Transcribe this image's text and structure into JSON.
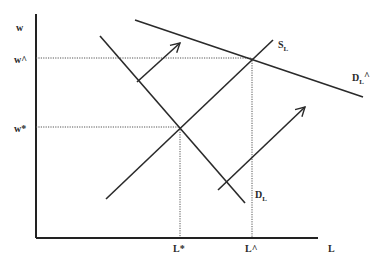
{
  "diagram": {
    "type": "labor-market supply and demand diagram",
    "axes": {
      "y_label": "w",
      "x_label": "L"
    },
    "y_ticks": [
      {
        "label": "w^",
        "meaning": "new equilibrium wage"
      },
      {
        "label": "w*",
        "meaning": "initial equilibrium wage"
      }
    ],
    "x_ticks": [
      {
        "label": "L*",
        "meaning": "initial equilibrium labor"
      },
      {
        "label": "L^",
        "meaning": "new equilibrium labor"
      }
    ],
    "curves": [
      {
        "id": "supply",
        "label": "S",
        "subscript": "L",
        "slope": "upward"
      },
      {
        "id": "demand",
        "label": "D",
        "subscript": "L",
        "slope": "downward"
      },
      {
        "id": "demand_new",
        "label": "D",
        "subscript": "L",
        "suffix": "^",
        "slope": "downward, flatter, shifted right"
      }
    ],
    "arrows": [
      {
        "id": "shift-arrow-upper",
        "direction": "up-right"
      },
      {
        "id": "shift-arrow-lower",
        "direction": "up-right"
      }
    ],
    "equilibria": [
      {
        "wage": "w*",
        "labor": "L*"
      },
      {
        "wage": "w^",
        "labor": "L^"
      }
    ]
  }
}
